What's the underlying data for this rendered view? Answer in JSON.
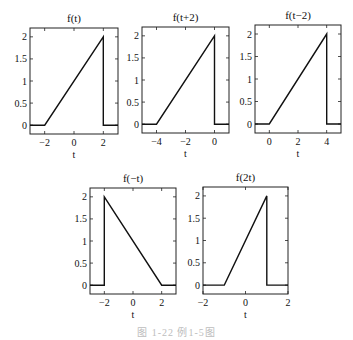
{
  "figure": {
    "caption": "图 1-22  例1-5图"
  },
  "chart_data": [
    {
      "type": "line",
      "title": "f(t)",
      "xlabel": "t",
      "ylabel": "",
      "xlim": [
        -3,
        3
      ],
      "ylim": [
        -0.2,
        2.2
      ],
      "xticks": [
        -2,
        0,
        2
      ],
      "xtick_labels": [
        "−2",
        "0",
        "2"
      ],
      "yticks": [
        0,
        0.5,
        1,
        1.5,
        2
      ],
      "ytick_labels": [
        "0",
        "0.5",
        "1",
        "1.5",
        "2"
      ],
      "show_ytick_labels": true,
      "grid": false,
      "x": [
        -3,
        -2,
        2,
        2,
        3
      ],
      "y": [
        0,
        0,
        2,
        0,
        0
      ],
      "frame": {
        "left": 30,
        "top": 28,
        "right": 118,
        "bottom": 134
      }
    },
    {
      "type": "line",
      "title": "f(t+2)",
      "xlabel": "t",
      "ylabel": "",
      "xlim": [
        -5,
        1
      ],
      "ylim": [
        -0.2,
        2.2
      ],
      "xticks": [
        -4,
        -2,
        0
      ],
      "xtick_labels": [
        "−4",
        "−2",
        "0"
      ],
      "yticks": [
        0,
        0.5,
        1,
        1.5,
        2
      ],
      "ytick_labels": [
        "0",
        "0.5",
        "1",
        "1.5",
        "2"
      ],
      "show_ytick_labels": true,
      "grid": false,
      "x": [
        -5,
        -4,
        0,
        0,
        1
      ],
      "y": [
        0,
        0,
        2,
        0,
        0
      ],
      "frame": {
        "left": 142,
        "top": 27,
        "right": 229,
        "bottom": 133
      }
    },
    {
      "type": "line",
      "title": "f(t−2)",
      "xlabel": "t",
      "ylabel": "",
      "xlim": [
        -1,
        5
      ],
      "ylim": [
        -0.2,
        2.2
      ],
      "xticks": [
        0,
        2,
        4
      ],
      "xtick_labels": [
        "0",
        "2",
        "4"
      ],
      "yticks": [
        0,
        0.5,
        1,
        1.5,
        2
      ],
      "ytick_labels": [
        "0",
        "0.5",
        "1",
        "1.5",
        "2"
      ],
      "show_ytick_labels": true,
      "grid": false,
      "x": [
        -1,
        0,
        4,
        4,
        5
      ],
      "y": [
        0,
        0,
        2,
        0,
        0
      ],
      "frame": {
        "left": 255,
        "top": 25,
        "right": 341,
        "bottom": 133
      }
    },
    {
      "type": "line",
      "title": "f(−t)",
      "xlabel": "t",
      "ylabel": "",
      "xlim": [
        -3,
        3
      ],
      "ylim": [
        -0.2,
        2.2
      ],
      "xticks": [
        -2,
        0,
        2
      ],
      "xtick_labels": [
        "−2",
        "0",
        "2"
      ],
      "yticks": [
        0,
        0.5,
        1,
        1.5,
        2
      ],
      "ytick_labels": [
        "0",
        "0.5",
        "1",
        "1.5",
        "2"
      ],
      "show_ytick_labels": true,
      "grid": false,
      "x": [
        -3,
        -2,
        -2,
        2,
        3
      ],
      "y": [
        0,
        0,
        2,
        0,
        0
      ],
      "frame": {
        "left": 90,
        "top": 188,
        "right": 176,
        "bottom": 294
      }
    },
    {
      "type": "line",
      "title": "f(2t)",
      "xlabel": "t",
      "ylabel": "",
      "xlim": [
        -2,
        2
      ],
      "ylim": [
        -0.2,
        2.2
      ],
      "xticks": [
        -2,
        0,
        2
      ],
      "xtick_labels": [
        "−2",
        "0",
        "2"
      ],
      "yticks": [
        0,
        0.5,
        1,
        1.5,
        2
      ],
      "ytick_labels": [
        "0",
        "0.5",
        "1",
        "1.5",
        "2"
      ],
      "show_ytick_labels": true,
      "grid": false,
      "x": [
        -2,
        -1,
        1,
        1,
        2
      ],
      "y": [
        0,
        0,
        2,
        0,
        0
      ],
      "frame": {
        "left": 203,
        "top": 187,
        "right": 288,
        "bottom": 294
      }
    }
  ]
}
